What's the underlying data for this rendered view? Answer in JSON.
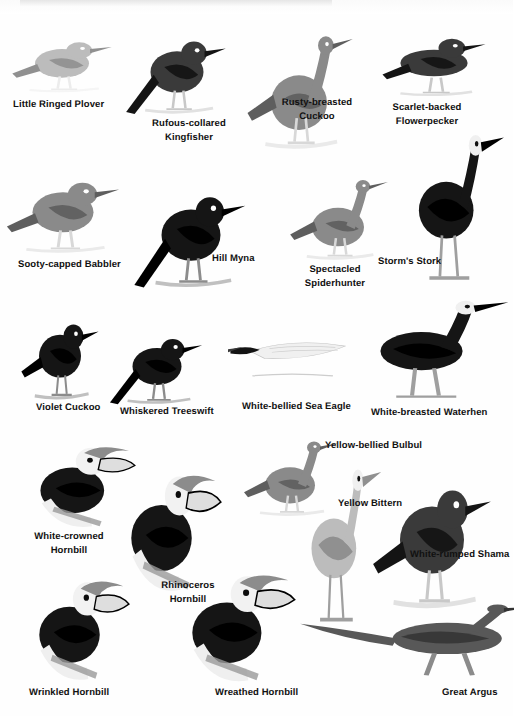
{
  "page": {
    "kind": "field-guide-plate",
    "title": "",
    "background_color": "#ffffff",
    "text_color": "#111111",
    "width": 513,
    "height": 716,
    "rows": 5,
    "illustration_count": 17,
    "style": "grayscale halftone bird illustrations with bold black captions"
  },
  "labels": [
    {
      "id": "little-ringed-plover",
      "text": "Little Ringed Plover",
      "lines": [
        "Little Ringed Plover"
      ],
      "x": 13,
      "y": 98,
      "w": 110,
      "align": "left"
    },
    {
      "id": "rufous-collared-kingfisher",
      "text": "Rufous-collared Kingfisher",
      "lines": [
        "Rufous-collared",
        "Kingfisher"
      ],
      "x": 139,
      "y": 117,
      "w": 100,
      "align": "center"
    },
    {
      "id": "rusty-breasted-cuckoo",
      "text": "Rusty-breasted Cuckoo",
      "lines": [
        "Rusty-breasted",
        "Cuckoo"
      ],
      "x": 274,
      "y": 96,
      "w": 86,
      "align": "center"
    },
    {
      "id": "scarlet-backed-flowerpecker",
      "text": "Scarlet-backed Flowerpecker",
      "lines": [
        "Scarlet-backed",
        "Flowerpecker"
      ],
      "x": 382,
      "y": 101,
      "w": 90,
      "align": "center"
    },
    {
      "id": "sooty-capped-babbler",
      "text": "Sooty-capped Babbler",
      "lines": [
        "Sooty-capped Babbler"
      ],
      "x": 18,
      "y": 258,
      "w": 110,
      "align": "left"
    },
    {
      "id": "hill-myna",
      "text": "Hill Myna",
      "lines": [
        "Hill Myna"
      ],
      "x": 212,
      "y": 252,
      "w": 52,
      "align": "left"
    },
    {
      "id": "spectacled-spiderhunter",
      "text": "Spectacled Spiderhunter",
      "lines": [
        "Spectacled",
        "Spiderhunter"
      ],
      "x": 296,
      "y": 263,
      "w": 78,
      "align": "center"
    },
    {
      "id": "storms-stork",
      "text": "Storm's Stork",
      "lines": [
        "Storm's Stork"
      ],
      "x": 378,
      "y": 255,
      "w": 74,
      "align": "left"
    },
    {
      "id": "violet-cuckoo",
      "text": "Violet Cuckoo",
      "lines": [
        "Violet Cuckoo"
      ],
      "x": 36,
      "y": 401,
      "w": 72,
      "align": "left"
    },
    {
      "id": "whiskered-treeswift",
      "text": "Whiskered Treeswift",
      "lines": [
        "Whiskered Treeswift"
      ],
      "x": 120,
      "y": 405,
      "w": 104,
      "align": "left"
    },
    {
      "id": "white-bellied-sea-eagle",
      "text": "White-bellied Sea Eagle",
      "lines": [
        "White-bellied Sea Eagle"
      ],
      "x": 242,
      "y": 400,
      "w": 116,
      "align": "left"
    },
    {
      "id": "white-breasted-waterhen",
      "text": "White-breasted Waterhen",
      "lines": [
        "White-breasted Waterhen"
      ],
      "x": 371,
      "y": 406,
      "w": 132,
      "align": "left"
    },
    {
      "id": "yellow-bellied-bulbul",
      "text": "Yellow-bellied Bulbul",
      "lines": [
        "Yellow-bellied Bulbul"
      ],
      "x": 325,
      "y": 439,
      "w": 110,
      "align": "left"
    },
    {
      "id": "white-crowned-hornbill",
      "text": "White-crowned Hornbill",
      "lines": [
        "White-crowned",
        "Hornbill"
      ],
      "x": 21,
      "y": 530,
      "w": 96,
      "align": "center"
    },
    {
      "id": "yellow-bittern",
      "text": "Yellow Bittern",
      "lines": [
        "Yellow Bittern"
      ],
      "x": 338,
      "y": 497,
      "w": 76,
      "align": "left"
    },
    {
      "id": "white-rumped-shama",
      "text": "White-rumped Shama",
      "lines": [
        "White-rumped Shama"
      ],
      "x": 410,
      "y": 548,
      "w": 104,
      "align": "left"
    },
    {
      "id": "rhinoceros-hornbill",
      "text": "Rhinoceros Hornbill",
      "lines": [
        "Rhinoceros",
        "Hornbill"
      ],
      "x": 147,
      "y": 579,
      "w": 82,
      "align": "center"
    },
    {
      "id": "wrinkled-hornbill",
      "text": "Wrinkled Hornbill",
      "lines": [
        "Wrinkled Hornbill"
      ],
      "x": 29,
      "y": 686,
      "w": 92,
      "align": "left"
    },
    {
      "id": "wreathed-hornbill",
      "text": "Wreathed Hornbill",
      "lines": [
        "Wreathed Hornbill"
      ],
      "x": 215,
      "y": 686,
      "w": 94,
      "align": "left"
    },
    {
      "id": "great-argus",
      "text": "Great Argus",
      "lines": [
        "Great Argus"
      ],
      "x": 442,
      "y": 686,
      "w": 64,
      "align": "left"
    }
  ],
  "illustrations": [
    {
      "id": "little-ringed-plover-art",
      "species": "Little Ringed Plover",
      "x": 8,
      "y": 26,
      "w": 108,
      "h": 68,
      "tone": "light-gray"
    },
    {
      "id": "rufous-collared-kingfisher-art",
      "species": "Rufous-collared Kingfisher",
      "x": 124,
      "y": 18,
      "w": 106,
      "h": 98,
      "tone": "dark"
    },
    {
      "id": "rusty-breasted-cuckoo-art",
      "species": "Rusty-breasted Cuckoo",
      "x": 243,
      "y": 22,
      "w": 112,
      "h": 130,
      "tone": "mid-gray"
    },
    {
      "id": "scarlet-backed-flowerpecker-art",
      "species": "Scarlet-backed Flowerpecker",
      "x": 378,
      "y": 20,
      "w": 112,
      "h": 78,
      "tone": "dark"
    },
    {
      "id": "sooty-capped-babbler-art",
      "species": "Sooty-capped Babbler",
      "x": 2,
      "y": 160,
      "w": 122,
      "h": 95,
      "tone": "mid-gray"
    },
    {
      "id": "hill-myna-art",
      "species": "Hill Myna",
      "x": 132,
      "y": 168,
      "w": 118,
      "h": 122,
      "tone": "black"
    },
    {
      "id": "spectacled-spiderhunter-art",
      "species": "Spectacled Spiderhunter",
      "x": 286,
      "y": 170,
      "w": 104,
      "h": 92,
      "tone": "mid-gray"
    },
    {
      "id": "storms-stork-art",
      "species": "Storm's Stork",
      "x": 400,
      "y": 128,
      "w": 105,
      "h": 158,
      "tone": "black"
    },
    {
      "id": "violet-cuckoo-art",
      "species": "Violet Cuckoo",
      "x": 18,
      "y": 300,
      "w": 84,
      "h": 102,
      "tone": "black"
    },
    {
      "id": "whiskered-treeswift-art",
      "species": "Whiskered Treeswift",
      "x": 108,
      "y": 318,
      "w": 98,
      "h": 88,
      "tone": "black"
    },
    {
      "id": "white-bellied-sea-eagle-art",
      "species": "White-bellied Sea Eagle",
      "x": 228,
      "y": 330,
      "w": 122,
      "h": 62,
      "tone": "white"
    },
    {
      "id": "white-breasted-waterhen-art",
      "species": "White-breasted Waterhen",
      "x": 352,
      "y": 296,
      "w": 158,
      "h": 106,
      "tone": "black"
    },
    {
      "id": "white-crowned-hornbill-art",
      "species": "White-crowned Hornbill",
      "x": 18,
      "y": 428,
      "w": 118,
      "h": 104,
      "tone": "black"
    },
    {
      "id": "rhinoceros-hornbill-art",
      "species": "Rhinoceros Hornbill",
      "x": 110,
      "y": 448,
      "w": 112,
      "h": 150,
      "tone": "black"
    },
    {
      "id": "yellow-bellied-bulbul-art",
      "species": "Yellow-bellied Bulbul",
      "x": 240,
      "y": 432,
      "w": 100,
      "h": 86,
      "tone": "mid-gray"
    },
    {
      "id": "yellow-bittern-art",
      "species": "Yellow Bittern",
      "x": 296,
      "y": 462,
      "w": 86,
      "h": 166,
      "tone": "light-gray"
    },
    {
      "id": "white-rumped-shama-art",
      "species": "White-rumped Shama",
      "x": 368,
      "y": 452,
      "w": 128,
      "h": 160,
      "tone": "dark"
    },
    {
      "id": "wrinkled-hornbill-art",
      "species": "Wrinkled Hornbill",
      "x": 18,
      "y": 558,
      "w": 112,
      "h": 128,
      "tone": "black"
    },
    {
      "id": "wreathed-hornbill-art",
      "species": "Wreathed Hornbill",
      "x": 168,
      "y": 550,
      "w": 128,
      "h": 138,
      "tone": "black"
    },
    {
      "id": "great-argus-art",
      "species": "Great Argus",
      "x": 296,
      "y": 598,
      "w": 210,
      "h": 92,
      "tone": "dark-gray"
    }
  ]
}
